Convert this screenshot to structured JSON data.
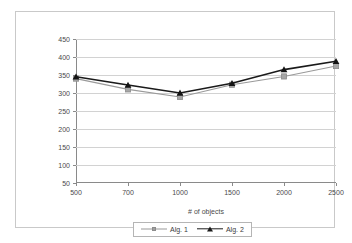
{
  "chart_data": {
    "type": "line",
    "title": "",
    "xlabel": "# of objects",
    "ylabel": "",
    "categories": [
      "500",
      "700",
      "1000",
      "1500",
      "2000",
      "2500"
    ],
    "x": [
      500,
      700,
      1000,
      1500,
      2000,
      2500
    ],
    "ylim": [
      50,
      450
    ],
    "ytick_labels": [
      "50",
      "100",
      "150",
      "200",
      "250",
      "300",
      "350",
      "400",
      "450"
    ],
    "yticks": [
      50,
      100,
      150,
      200,
      250,
      300,
      350,
      400,
      450
    ],
    "grid": true,
    "legend_position": "bottom",
    "series": [
      {
        "name": "Alg. 1",
        "values": [
          340,
          310,
          289,
          323,
          346,
          375
        ],
        "color": "#9a9a9a",
        "marker": "square"
      },
      {
        "name": "Alg. 2",
        "values": [
          345,
          322,
          300,
          327,
          365,
          388
        ],
        "color": "#1a1a1a",
        "marker": "triangle"
      }
    ]
  },
  "legend": {
    "entries": [
      {
        "label": "Alg. 1",
        "marker_icon": "square-marker-icon"
      },
      {
        "label": "Alg. 2",
        "marker_icon": "triangle-marker-icon"
      }
    ]
  }
}
